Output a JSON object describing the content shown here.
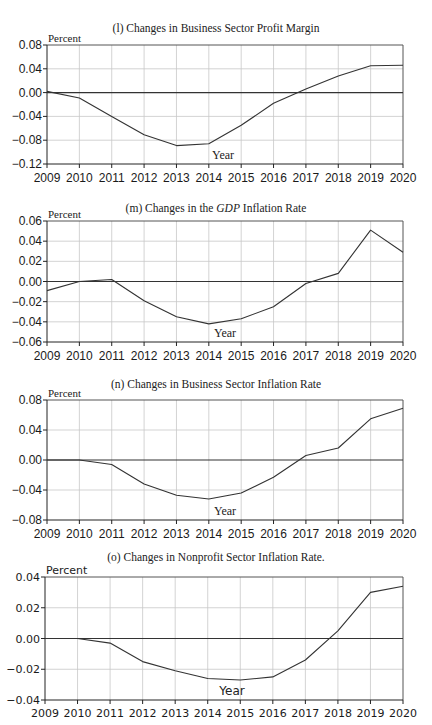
{
  "chart_data": [
    {
      "type": "line",
      "title": "(l) Changes in Business Sector Profit Margin",
      "title_parts": {
        "prefix": "(l) Changes in Business Sector Profit Margin",
        "italic": "",
        "suffix": ""
      },
      "ylabel": "Percent",
      "xlabel": "Year",
      "x": [
        2009,
        2010,
        2011,
        2012,
        2013,
        2014,
        2015,
        2016,
        2017,
        2018,
        2019,
        2020
      ],
      "series": [
        {
          "name": "Business Sector Profit Margin",
          "values": [
            0.002,
            -0.009,
            -0.04,
            -0.071,
            -0.089,
            -0.086,
            -0.055,
            -0.018,
            0.006,
            0.028,
            0.045,
            0.046
          ]
        }
      ],
      "ylim": [
        -0.12,
        0.08
      ],
      "yticks": [
        "0.08",
        "0.04",
        "0.00",
        "−0.04",
        "−0.08",
        "−0.12"
      ],
      "ytick_values": [
        0.08,
        0.04,
        0.0,
        -0.04,
        -0.08,
        -0.12
      ],
      "grid": true,
      "legend": "none"
    },
    {
      "type": "line",
      "title": "(m) Changes in the GDP Inflation Rate",
      "title_parts": {
        "prefix": "(m) Changes in the ",
        "italic": "GDP",
        "suffix": " Inflation Rate"
      },
      "ylabel": "Percent",
      "xlabel": "Year",
      "x": [
        2009,
        2010,
        2011,
        2012,
        2013,
        2014,
        2015,
        2016,
        2017,
        2018,
        2019,
        2020
      ],
      "series": [
        {
          "name": "GDP Inflation Rate",
          "values": [
            -0.009,
            0.0,
            0.002,
            -0.019,
            -0.035,
            -0.042,
            -0.037,
            -0.025,
            -0.002,
            0.008,
            0.051,
            0.029
          ]
        }
      ],
      "ylim": [
        -0.06,
        0.06
      ],
      "yticks": [
        "0.06",
        "0.04",
        "0.02",
        "0.00",
        "−0.02",
        "−0.04",
        "−0.06"
      ],
      "ytick_values": [
        0.06,
        0.04,
        0.02,
        0.0,
        -0.02,
        -0.04,
        -0.06
      ],
      "grid": true,
      "legend": "none"
    },
    {
      "type": "line",
      "title": "(n) Changes in Business Sector Inflation Rate",
      "title_parts": {
        "prefix": "(n) Changes in Business Sector Inflation Rate",
        "italic": "",
        "suffix": ""
      },
      "ylabel": "Percent",
      "xlabel": "Year",
      "x": [
        2009,
        2010,
        2011,
        2012,
        2013,
        2014,
        2015,
        2016,
        2017,
        2018,
        2019,
        2020
      ],
      "series": [
        {
          "name": "Business Sector Inflation Rate",
          "values": [
            0.0,
            0.0,
            -0.006,
            -0.032,
            -0.047,
            -0.052,
            -0.044,
            -0.023,
            0.006,
            0.016,
            0.055,
            0.069
          ]
        }
      ],
      "ylim": [
        -0.08,
        0.08
      ],
      "yticks": [
        "0.08",
        "0.04",
        "0.00",
        "−0.04",
        "−0.08"
      ],
      "ytick_values": [
        0.08,
        0.04,
        0.0,
        -0.04,
        -0.08
      ],
      "grid": true,
      "legend": "none"
    },
    {
      "type": "line",
      "title": "(o) Changes in Nonprofit Sector Inflation Rate.",
      "title_parts": {
        "prefix": "(o) Changes in Nonprofit Sector Inflation Rate.",
        "italic": "",
        "suffix": ""
      },
      "ylabel": "Percent",
      "xlabel": "Year",
      "x": [
        2009,
        2010,
        2011,
        2012,
        2013,
        2014,
        2015,
        2016,
        2017,
        2018,
        2019,
        2020
      ],
      "series": [
        {
          "name": "Nonprofit Sector Inflation Rate",
          "values": [
            0.0,
            0.0,
            -0.003,
            -0.015,
            -0.021,
            -0.026,
            -0.027,
            -0.025,
            -0.014,
            0.005,
            0.03,
            0.034
          ]
        }
      ],
      "ylim": [
        -0.04,
        0.04
      ],
      "yticks": [
        "0.04",
        "0.02",
        "0.00",
        "−0.02",
        "−0.04"
      ],
      "ytick_values": [
        0.04,
        0.02,
        0.0,
        -0.02,
        -0.04
      ],
      "grid": true,
      "legend": "none"
    }
  ],
  "layout": {
    "panels": [
      {
        "title_top": 22,
        "plot_top": 45,
        "plot_bottom": 164,
        "plot_left": 47,
        "plot_right": 403,
        "year_y": 182,
        "xlabel_x": 223,
        "xlabel_y": 159,
        "alt_font": false
      },
      {
        "title_top": 202,
        "plot_top": 221,
        "plot_bottom": 342,
        "plot_left": 47,
        "plot_right": 403,
        "year_y": 360,
        "xlabel_x": 225,
        "xlabel_y": 337,
        "alt_font": false
      },
      {
        "title_top": 378,
        "plot_top": 400,
        "plot_bottom": 520,
        "plot_left": 47,
        "plot_right": 403,
        "year_y": 538,
        "xlabel_x": 225,
        "xlabel_y": 515,
        "alt_font": false
      },
      {
        "title_top": 551,
        "plot_top": 577,
        "plot_bottom": 700,
        "plot_left": 45,
        "plot_right": 403,
        "year_y": 717,
        "xlabel_x": 232,
        "xlabel_y": 695,
        "alt_font": true
      }
    ],
    "colors": {
      "line": "#333333",
      "zero_line": "#333333",
      "grid": "#c8c8c8",
      "axis": "#222222"
    }
  }
}
